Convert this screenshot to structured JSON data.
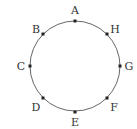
{
  "diagram": {
    "type": "circle-with-points",
    "center": [
      75,
      66
    ],
    "radius": 45,
    "stroke_color": "#555555",
    "point_color": "#222222",
    "points": [
      {
        "label": "A",
        "x": 75,
        "y": 21,
        "lx": 75,
        "ly": 14,
        "anchor": "middle"
      },
      {
        "label": "B",
        "x": 43,
        "y": 34,
        "lx": 36,
        "ly": 33,
        "anchor": "middle"
      },
      {
        "label": "C",
        "x": 30,
        "y": 66,
        "lx": 21,
        "ly": 70,
        "anchor": "middle"
      },
      {
        "label": "D",
        "x": 43,
        "y": 98,
        "lx": 36,
        "ly": 111,
        "anchor": "middle"
      },
      {
        "label": "E",
        "x": 75,
        "y": 112,
        "lx": 75,
        "ly": 126,
        "anchor": "middle"
      },
      {
        "label": "F",
        "x": 107,
        "y": 98,
        "lx": 114,
        "ly": 111,
        "anchor": "middle"
      },
      {
        "label": "G",
        "x": 120,
        "y": 66,
        "lx": 129,
        "ly": 70,
        "anchor": "middle"
      },
      {
        "label": "H",
        "x": 107,
        "y": 34,
        "lx": 115,
        "ly": 33,
        "anchor": "middle"
      }
    ]
  }
}
